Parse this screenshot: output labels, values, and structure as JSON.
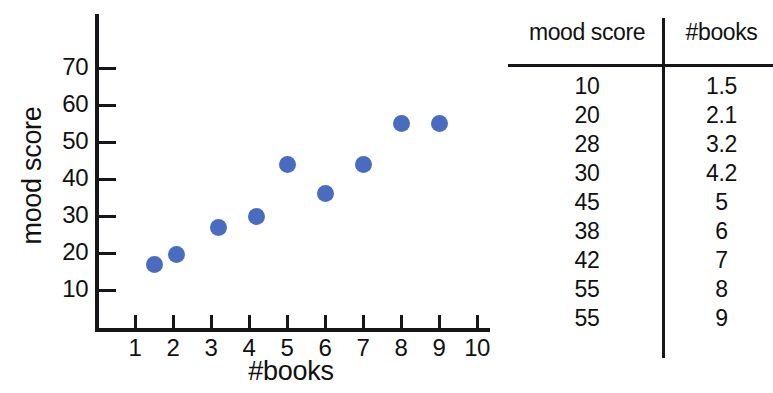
{
  "chart_data": {
    "type": "scatter",
    "title": "",
    "xlabel": "#books",
    "ylabel": "mood score",
    "xlim": [
      0,
      10.5
    ],
    "ylim": [
      0,
      75
    ],
    "grid": false,
    "legend": "none",
    "x_ticks": [
      "1",
      "2",
      "3",
      "4",
      "5",
      "6",
      "7",
      "8",
      "9",
      "10"
    ],
    "y_ticks": [
      "10",
      "20",
      "30",
      "40",
      "50",
      "60",
      "70"
    ],
    "point_color": "#4a6cc0",
    "points": [
      {
        "x": 1.5,
        "y": 17
      },
      {
        "x": 2.1,
        "y": 19.5
      },
      {
        "x": 3.2,
        "y": 27
      },
      {
        "x": 4.2,
        "y": 30
      },
      {
        "x": 5,
        "y": 44
      },
      {
        "x": 6,
        "y": 36
      },
      {
        "x": 7,
        "y": 44
      },
      {
        "x": 8,
        "y": 55
      },
      {
        "x": 9,
        "y": 55
      }
    ]
  },
  "table": {
    "columns": [
      "mood score",
      "#books"
    ],
    "rows": [
      {
        "mood_score": "10",
        "books": "1.5"
      },
      {
        "mood_score": "20",
        "books": "2.1"
      },
      {
        "mood_score": "28",
        "books": "3.2"
      },
      {
        "mood_score": "30",
        "books": "4.2"
      },
      {
        "mood_score": "45",
        "books": "5"
      },
      {
        "mood_score": "38",
        "books": "6"
      },
      {
        "mood_score": "42",
        "books": "7"
      },
      {
        "mood_score": "55",
        "books": "8"
      },
      {
        "mood_score": "55",
        "books": "9"
      }
    ]
  }
}
